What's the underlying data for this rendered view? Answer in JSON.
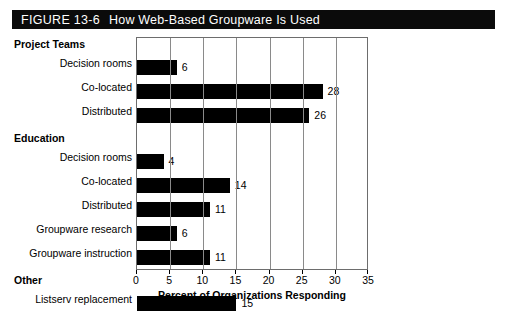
{
  "figure": {
    "number": "FIGURE 13-6",
    "title": "How Web-Based Groupware Is Used",
    "banner_color": "#0b0b0b",
    "banner_text_color": "#ffffff"
  },
  "chart_data": {
    "type": "bar",
    "orientation": "horizontal",
    "title": "How Web-Based Groupware Is Used",
    "xlabel": "Percent of Organizations Responding",
    "ylabel": "",
    "xlim": [
      0,
      35
    ],
    "xticks": [
      0,
      5,
      10,
      15,
      20,
      25,
      30,
      35
    ],
    "xtick_labels": [
      "0",
      "5",
      "10",
      "15",
      "20",
      "25",
      "30",
      "35"
    ],
    "grid": true,
    "grid_axis": "x",
    "legend": false,
    "bar_color": "#000000",
    "groups": [
      {
        "name": "Project Teams",
        "categories": [
          "Decision rooms",
          "Co-located",
          "Distributed"
        ],
        "values": [
          6,
          28,
          26
        ]
      },
      {
        "name": "Education",
        "categories": [
          "Decision rooms",
          "Co-located",
          "Distributed",
          "Groupware research",
          "Groupware instruction"
        ],
        "values": [
          4,
          14,
          11,
          6,
          11
        ]
      },
      {
        "name": "Other",
        "categories": [
          "Listserv replacement"
        ],
        "values": [
          15
        ]
      }
    ],
    "categories": [
      "Decision rooms",
      "Co-located",
      "Distributed",
      "Decision rooms",
      "Co-located",
      "Distributed",
      "Groupware research",
      "Groupware instruction",
      "Listserv replacement"
    ],
    "values": [
      6,
      28,
      26,
      4,
      14,
      11,
      6,
      11,
      15
    ],
    "data_labels": [
      "6",
      "28",
      "26",
      "4",
      "14",
      "11",
      "6",
      "11",
      "15"
    ]
  }
}
